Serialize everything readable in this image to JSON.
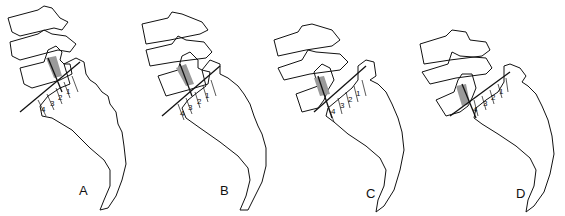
{
  "figure": {
    "panels": [
      {
        "label": "A",
        "grades": [
          "4",
          "3",
          "2",
          "1"
        ]
      },
      {
        "label": "B",
        "grades": [
          "4",
          "3",
          "2",
          "1"
        ]
      },
      {
        "label": "C",
        "grades": [
          "4",
          "3",
          "2",
          "1"
        ]
      },
      {
        "label": "D",
        "grades": [
          "4",
          "3",
          "2",
          "1"
        ]
      }
    ],
    "colors": {
      "line": "#111111",
      "shading": "#9a9a9a",
      "background": "#ffffff"
    }
  }
}
